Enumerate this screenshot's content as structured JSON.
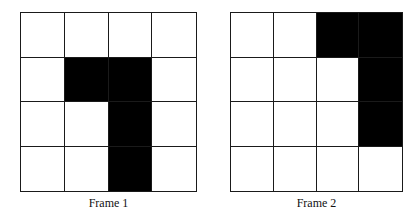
{
  "frames": [
    {
      "caption": "Frame 1",
      "rows": 4,
      "cols": 4,
      "filled_cells": [
        [
          1,
          1
        ],
        [
          1,
          2
        ],
        [
          2,
          2
        ],
        [
          3,
          2
        ]
      ],
      "box": {
        "x": 20,
        "y": 12,
        "w": 177,
        "h": 180
      }
    },
    {
      "caption": "Frame 2",
      "rows": 4,
      "cols": 4,
      "filled_cells": [
        [
          0,
          2
        ],
        [
          0,
          3
        ],
        [
          1,
          3
        ],
        [
          2,
          3
        ]
      ],
      "box": {
        "x": 230,
        "y": 12,
        "w": 173,
        "h": 180
      }
    }
  ],
  "colors": {
    "filled": "#000000",
    "empty": "#ffffff",
    "grid_line": "#1a1a1a"
  }
}
